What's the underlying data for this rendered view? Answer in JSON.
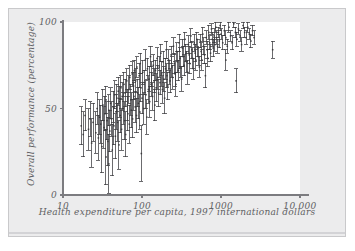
{
  "figure": {
    "background_color": "#ffffff",
    "panel_color": "#ececed",
    "plot_color": "#ffffff",
    "frame_color": "#c9c9cb",
    "ink_color": "#5f5f63",
    "marker_color": "#3a3a3d"
  },
  "chart_data": {
    "type": "scatter",
    "title": "",
    "subtitle": "",
    "xlabel": "Health expenditure per capita, 1997 international dollars",
    "ylabel": "Overall performance (percentage)",
    "xscale": "log",
    "yscale": "linear",
    "xlim": [
      10,
      10000
    ],
    "ylim": [
      0,
      100
    ],
    "xticks": [
      10,
      100,
      1000,
      10000
    ],
    "xtick_labels": [
      "10",
      "100",
      "1000",
      "10 000"
    ],
    "yticks": [
      0,
      50,
      100
    ],
    "ytick_labels": [
      "0",
      "50",
      "100"
    ],
    "grid": false,
    "legend": null,
    "error_bars": "vertical",
    "marker_style": "i-beam-error-bar",
    "n_points": 191,
    "annotations": [],
    "series": [
      {
        "name": "Countries",
        "points": [
          {
            "x": 17,
            "y": 40,
            "err": 11
          },
          {
            "x": 18,
            "y": 35,
            "err": 13
          },
          {
            "x": 19,
            "y": 46,
            "err": 9
          },
          {
            "x": 21,
            "y": 38,
            "err": 12
          },
          {
            "x": 22,
            "y": 44,
            "err": 10
          },
          {
            "x": 23,
            "y": 30,
            "err": 14
          },
          {
            "x": 24,
            "y": 42,
            "err": 11
          },
          {
            "x": 26,
            "y": 36,
            "err": 12
          },
          {
            "x": 27,
            "y": 50,
            "err": 9
          },
          {
            "x": 28,
            "y": 33,
            "err": 13
          },
          {
            "x": 29,
            "y": 45,
            "err": 10
          },
          {
            "x": 30,
            "y": 41,
            "err": 11
          },
          {
            "x": 31,
            "y": 28,
            "err": 15
          },
          {
            "x": 32,
            "y": 52,
            "err": 9
          },
          {
            "x": 33,
            "y": 39,
            "err": 12
          },
          {
            "x": 34,
            "y": 47,
            "err": 10
          },
          {
            "x": 35,
            "y": 22,
            "err": 16
          },
          {
            "x": 35,
            "y": 55,
            "err": 8
          },
          {
            "x": 36,
            "y": 43,
            "err": 11
          },
          {
            "x": 37,
            "y": 31,
            "err": 14
          },
          {
            "x": 38,
            "y": 49,
            "err": 9
          },
          {
            "x": 38,
            "y": 18,
            "err": 17
          },
          {
            "x": 39,
            "y": 37,
            "err": 12
          },
          {
            "x": 40,
            "y": 53,
            "err": 9
          },
          {
            "x": 41,
            "y": 44,
            "err": 10
          },
          {
            "x": 42,
            "y": 26,
            "err": 15
          },
          {
            "x": 43,
            "y": 51,
            "err": 9
          },
          {
            "x": 44,
            "y": 40,
            "err": 11
          },
          {
            "x": 45,
            "y": 58,
            "err": 8
          },
          {
            "x": 46,
            "y": 34,
            "err": 13
          },
          {
            "x": 47,
            "y": 48,
            "err": 10
          },
          {
            "x": 48,
            "y": 56,
            "err": 8
          },
          {
            "x": 49,
            "y": 42,
            "err": 11
          },
          {
            "x": 50,
            "y": 60,
            "err": 8
          },
          {
            "x": 51,
            "y": 29,
            "err": 14
          },
          {
            "x": 52,
            "y": 54,
            "err": 9
          },
          {
            "x": 53,
            "y": 46,
            "err": 10
          },
          {
            "x": 54,
            "y": 62,
            "err": 7
          },
          {
            "x": 55,
            "y": 38,
            "err": 12
          },
          {
            "x": 56,
            "y": 57,
            "err": 8
          },
          {
            "x": 58,
            "y": 50,
            "err": 9
          },
          {
            "x": 59,
            "y": 64,
            "err": 7
          },
          {
            "x": 60,
            "y": 43,
            "err": 11
          },
          {
            "x": 61,
            "y": 59,
            "err": 8
          },
          {
            "x": 62,
            "y": 35,
            "err": 13
          },
          {
            "x": 64,
            "y": 66,
            "err": 7
          },
          {
            "x": 65,
            "y": 52,
            "err": 9
          },
          {
            "x": 66,
            "y": 47,
            "err": 10
          },
          {
            "x": 68,
            "y": 61,
            "err": 8
          },
          {
            "x": 69,
            "y": 41,
            "err": 11
          },
          {
            "x": 70,
            "y": 68,
            "err": 7
          },
          {
            "x": 72,
            "y": 55,
            "err": 9
          },
          {
            "x": 73,
            "y": 49,
            "err": 10
          },
          {
            "x": 75,
            "y": 70,
            "err": 7
          },
          {
            "x": 76,
            "y": 44,
            "err": 11
          },
          {
            "x": 78,
            "y": 63,
            "err": 8
          },
          {
            "x": 79,
            "y": 57,
            "err": 8
          },
          {
            "x": 80,
            "y": 72,
            "err": 6
          },
          {
            "x": 82,
            "y": 51,
            "err": 9
          },
          {
            "x": 83,
            "y": 66,
            "err": 7
          },
          {
            "x": 85,
            "y": 46,
            "err": 10
          },
          {
            "x": 86,
            "y": 74,
            "err": 6
          },
          {
            "x": 88,
            "y": 59,
            "err": 8
          },
          {
            "x": 90,
            "y": 53,
            "err": 9
          },
          {
            "x": 92,
            "y": 69,
            "err": 7
          },
          {
            "x": 94,
            "y": 48,
            "err": 10
          },
          {
            "x": 95,
            "y": 76,
            "err": 6
          },
          {
            "x": 97,
            "y": 62,
            "err": 8
          },
          {
            "x": 98,
            "y": 24,
            "err": 16
          },
          {
            "x": 100,
            "y": 56,
            "err": 9
          },
          {
            "x": 102,
            "y": 71,
            "err": 7
          },
          {
            "x": 105,
            "y": 50,
            "err": 9
          },
          {
            "x": 107,
            "y": 65,
            "err": 7
          },
          {
            "x": 110,
            "y": 78,
            "err": 6
          },
          {
            "x": 112,
            "y": 58,
            "err": 8
          },
          {
            "x": 115,
            "y": 45,
            "err": 10
          },
          {
            "x": 117,
            "y": 73,
            "err": 6
          },
          {
            "x": 120,
            "y": 61,
            "err": 8
          },
          {
            "x": 123,
            "y": 67,
            "err": 7
          },
          {
            "x": 125,
            "y": 54,
            "err": 9
          },
          {
            "x": 128,
            "y": 80,
            "err": 6
          },
          {
            "x": 130,
            "y": 64,
            "err": 7
          },
          {
            "x": 133,
            "y": 70,
            "err": 7
          },
          {
            "x": 136,
            "y": 57,
            "err": 8
          },
          {
            "x": 139,
            "y": 75,
            "err": 6
          },
          {
            "x": 142,
            "y": 66,
            "err": 7
          },
          {
            "x": 145,
            "y": 52,
            "err": 9
          },
          {
            "x": 148,
            "y": 72,
            "err": 6
          },
          {
            "x": 151,
            "y": 62,
            "err": 8
          },
          {
            "x": 155,
            "y": 79,
            "err": 6
          },
          {
            "x": 158,
            "y": 68,
            "err": 7
          },
          {
            "x": 162,
            "y": 59,
            "err": 8
          },
          {
            "x": 165,
            "y": 74,
            "err": 6
          },
          {
            "x": 169,
            "y": 65,
            "err": 7
          },
          {
            "x": 173,
            "y": 82,
            "err": 5
          },
          {
            "x": 177,
            "y": 70,
            "err": 7
          },
          {
            "x": 181,
            "y": 61,
            "err": 8
          },
          {
            "x": 185,
            "y": 77,
            "err": 6
          },
          {
            "x": 189,
            "y": 67,
            "err": 7
          },
          {
            "x": 193,
            "y": 56,
            "err": 9
          },
          {
            "x": 198,
            "y": 73,
            "err": 6
          },
          {
            "x": 202,
            "y": 84,
            "err": 5
          },
          {
            "x": 207,
            "y": 69,
            "err": 7
          },
          {
            "x": 212,
            "y": 63,
            "err": 8
          },
          {
            "x": 217,
            "y": 78,
            "err": 6
          },
          {
            "x": 222,
            "y": 71,
            "err": 7
          },
          {
            "x": 227,
            "y": 66,
            "err": 7
          },
          {
            "x": 233,
            "y": 81,
            "err": 5
          },
          {
            "x": 238,
            "y": 74,
            "err": 6
          },
          {
            "x": 244,
            "y": 68,
            "err": 7
          },
          {
            "x": 250,
            "y": 86,
            "err": 5
          },
          {
            "x": 256,
            "y": 76,
            "err": 6
          },
          {
            "x": 262,
            "y": 70,
            "err": 7
          },
          {
            "x": 268,
            "y": 64,
            "err": 7
          },
          {
            "x": 275,
            "y": 83,
            "err": 5
          },
          {
            "x": 281,
            "y": 77,
            "err": 6
          },
          {
            "x": 288,
            "y": 72,
            "err": 6
          },
          {
            "x": 295,
            "y": 88,
            "err": 5
          },
          {
            "x": 302,
            "y": 79,
            "err": 6
          },
          {
            "x": 310,
            "y": 74,
            "err": 6
          },
          {
            "x": 317,
            "y": 67,
            "err": 7
          },
          {
            "x": 325,
            "y": 85,
            "err": 5
          },
          {
            "x": 333,
            "y": 80,
            "err": 6
          },
          {
            "x": 341,
            "y": 75,
            "err": 6
          },
          {
            "x": 350,
            "y": 90,
            "err": 4
          },
          {
            "x": 358,
            "y": 82,
            "err": 5
          },
          {
            "x": 367,
            "y": 77,
            "err": 6
          },
          {
            "x": 376,
            "y": 71,
            "err": 7
          },
          {
            "x": 386,
            "y": 87,
            "err": 5
          },
          {
            "x": 395,
            "y": 81,
            "err": 5
          },
          {
            "x": 405,
            "y": 76,
            "err": 6
          },
          {
            "x": 415,
            "y": 92,
            "err": 4
          },
          {
            "x": 426,
            "y": 84,
            "err": 5
          },
          {
            "x": 436,
            "y": 79,
            "err": 6
          },
          {
            "x": 447,
            "y": 73,
            "err": 6
          },
          {
            "x": 458,
            "y": 88,
            "err": 5
          },
          {
            "x": 470,
            "y": 82,
            "err": 5
          },
          {
            "x": 482,
            "y": 78,
            "err": 6
          },
          {
            "x": 494,
            "y": 90,
            "err": 4
          },
          {
            "x": 506,
            "y": 85,
            "err": 5
          },
          {
            "x": 519,
            "y": 80,
            "err": 5
          },
          {
            "x": 532,
            "y": 74,
            "err": 6
          },
          {
            "x": 546,
            "y": 89,
            "err": 4
          },
          {
            "x": 559,
            "y": 83,
            "err": 5
          },
          {
            "x": 574,
            "y": 78,
            "err": 6
          },
          {
            "x": 588,
            "y": 93,
            "err": 4
          },
          {
            "x": 603,
            "y": 86,
            "err": 5
          },
          {
            "x": 618,
            "y": 81,
            "err": 5
          },
          {
            "x": 634,
            "y": 69,
            "err": 7
          },
          {
            "x": 650,
            "y": 91,
            "err": 4
          },
          {
            "x": 667,
            "y": 84,
            "err": 5
          },
          {
            "x": 684,
            "y": 79,
            "err": 5
          },
          {
            "x": 701,
            "y": 94,
            "err": 4
          },
          {
            "x": 719,
            "y": 88,
            "err": 4
          },
          {
            "x": 737,
            "y": 82,
            "err": 5
          },
          {
            "x": 756,
            "y": 96,
            "err": 3
          },
          {
            "x": 776,
            "y": 90,
            "err": 4
          },
          {
            "x": 795,
            "y": 85,
            "err": 5
          },
          {
            "x": 816,
            "y": 92,
            "err": 4
          },
          {
            "x": 837,
            "y": 87,
            "err": 4
          },
          {
            "x": 858,
            "y": 97,
            "err": 3
          },
          {
            "x": 880,
            "y": 91,
            "err": 4
          },
          {
            "x": 903,
            "y": 86,
            "err": 4
          },
          {
            "x": 926,
            "y": 94,
            "err": 3
          },
          {
            "x": 950,
            "y": 89,
            "err": 4
          },
          {
            "x": 974,
            "y": 98,
            "err": 3
          },
          {
            "x": 1000,
            "y": 93,
            "err": 3
          },
          {
            "x": 1050,
            "y": 88,
            "err": 4
          },
          {
            "x": 1100,
            "y": 95,
            "err": 3
          },
          {
            "x": 1150,
            "y": 91,
            "err": 4
          },
          {
            "x": 1200,
            "y": 86,
            "err": 4
          },
          {
            "x": 1260,
            "y": 97,
            "err": 3
          },
          {
            "x": 1320,
            "y": 92,
            "err": 3
          },
          {
            "x": 1380,
            "y": 88,
            "err": 4
          },
          {
            "x": 1450,
            "y": 99,
            "err": 2
          },
          {
            "x": 1520,
            "y": 94,
            "err": 3
          },
          {
            "x": 1590,
            "y": 90,
            "err": 4
          },
          {
            "x": 1660,
            "y": 96,
            "err": 3
          },
          {
            "x": 1740,
            "y": 92,
            "err": 3
          },
          {
            "x": 1820,
            "y": 87,
            "err": 4
          },
          {
            "x": 1900,
            "y": 98,
            "err": 2
          },
          {
            "x": 1990,
            "y": 94,
            "err": 3
          },
          {
            "x": 2080,
            "y": 91,
            "err": 4
          },
          {
            "x": 2180,
            "y": 97,
            "err": 3
          },
          {
            "x": 2280,
            "y": 93,
            "err": 3
          },
          {
            "x": 2390,
            "y": 89,
            "err": 4
          },
          {
            "x": 2500,
            "y": 95,
            "err": 3
          },
          {
            "x": 2620,
            "y": 91,
            "err": 4
          },
          {
            "x": 1550,
            "y": 66,
            "err": 7
          },
          {
            "x": 1150,
            "y": 78,
            "err": 6
          },
          {
            "x": 4500,
            "y": 84,
            "err": 5
          }
        ]
      }
    ]
  }
}
